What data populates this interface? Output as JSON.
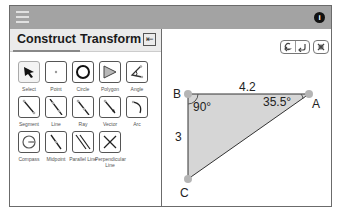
{
  "header": {
    "menu_icon": "hamburger-icon",
    "info_icon": "info-icon",
    "info_glyph": "i"
  },
  "tabs": [
    {
      "label": "Construct",
      "active": true
    },
    {
      "label": "Transform",
      "active": false
    }
  ],
  "collapse_glyph": "⇤",
  "tools": [
    {
      "label": "Select",
      "icon": "arrow-cursor-icon",
      "selected": true
    },
    {
      "label": "Point",
      "icon": "point-icon"
    },
    {
      "label": "Circle",
      "icon": "circle-icon"
    },
    {
      "label": "Polygon",
      "icon": "polygon-icon"
    },
    {
      "label": "Angle",
      "icon": "angle-icon"
    },
    {
      "label": "Segment",
      "icon": "segment-icon"
    },
    {
      "label": "Line",
      "icon": "line-icon"
    },
    {
      "label": "Ray",
      "icon": "ray-icon"
    },
    {
      "label": "Vector",
      "icon": "vector-icon"
    },
    {
      "label": "Arc",
      "icon": "arc-icon"
    },
    {
      "label": "Compass",
      "icon": "compass-icon"
    },
    {
      "label": "Midpoint",
      "icon": "midpoint-icon"
    },
    {
      "label": "Parallel Line",
      "icon": "parallel-line-icon"
    },
    {
      "label": "Perpendicular Line",
      "icon": "perpendicular-line-icon"
    }
  ],
  "canvas": {
    "controls": {
      "undo": "undo-icon",
      "redo": "redo-icon",
      "clear": "clear-icon"
    },
    "points": {
      "A": "A",
      "B": "B",
      "C": "C"
    },
    "side_top": "4.2",
    "side_left": "3",
    "angle_B": "90°",
    "angle_A": "35.5°",
    "fill_color": "#d6d6d6",
    "point_color": "#b5b5b5"
  }
}
